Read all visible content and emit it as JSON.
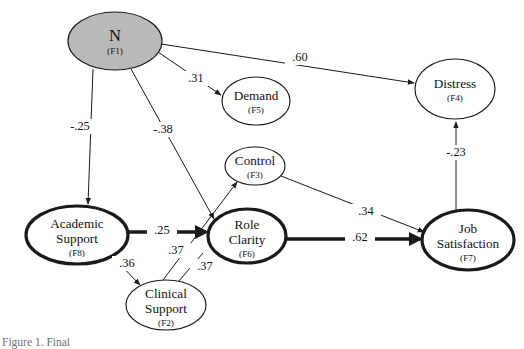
{
  "figure": {
    "type": "structural-equation-model-path-diagram",
    "background_color": "#ffffff",
    "stroke_color": "#1a1a1a",
    "shaded_fill": "#b9b9b9",
    "caption": "Figure 1. Final"
  },
  "nodes": [
    {
      "id": "F1",
      "name": "N",
      "code": "(F1)",
      "cx": 115,
      "cy": 41,
      "rx": 47,
      "ry": 29,
      "style": "shaded",
      "emphasis": "shaded",
      "label_size": "big"
    },
    {
      "id": "F5",
      "name": "Demand",
      "code": "(F5)",
      "cx": 256,
      "cy": 101,
      "rx": 34,
      "ry": 24,
      "style": "thin",
      "emphasis": "normal",
      "label_size": "main"
    },
    {
      "id": "F4",
      "name": "Distress",
      "code": "(F4)",
      "cx": 455,
      "cy": 89,
      "rx": 40,
      "ry": 30,
      "style": "thin",
      "emphasis": "normal",
      "label_size": "main"
    },
    {
      "id": "F3",
      "name": "Control",
      "code": "(F3)",
      "cx": 255,
      "cy": 166,
      "rx": 30,
      "ry": 19,
      "style": "thin",
      "emphasis": "normal",
      "label_size": "main"
    },
    {
      "id": "F8",
      "name": "Academic Support",
      "code": "(F8)",
      "cx": 77,
      "cy": 235,
      "rx": 51,
      "ry": 29,
      "style": "thick",
      "emphasis": "bold",
      "label_size": "main"
    },
    {
      "id": "F6",
      "name": "Role Clarity",
      "code": "(F6)",
      "cx": 247,
      "cy": 236,
      "rx": 39,
      "ry": 27,
      "style": "thick",
      "emphasis": "bold",
      "label_size": "main"
    },
    {
      "id": "F2",
      "name": "Clinical Support",
      "code": "(F2)",
      "cx": 166,
      "cy": 305,
      "rx": 40,
      "ry": 25,
      "style": "thin",
      "emphasis": "normal",
      "label_size": "main"
    },
    {
      "id": "F7",
      "name": "Job Satisfaction",
      "code": "(F7)",
      "cx": 468,
      "cy": 240,
      "rx": 46,
      "ry": 30,
      "style": "thick",
      "emphasis": "bold",
      "label_size": "main"
    }
  ],
  "paths": [
    {
      "id": "p-n-distress",
      "from": "F1",
      "to": "F4",
      "coefficient": ".60",
      "weight": "thin",
      "arrow": true,
      "x1": 161,
      "y1": 44,
      "x2": 414,
      "y2": 83,
      "label_x": 300,
      "label_y": 58
    },
    {
      "id": "p-n-demand",
      "from": "F1",
      "to": "F5",
      "coefficient": ".31",
      "weight": "thin",
      "arrow": true,
      "x1": 158,
      "y1": 52,
      "x2": 221,
      "y2": 95,
      "label_x": 196,
      "label_y": 79
    },
    {
      "id": "p-n-academic",
      "from": "F1",
      "to": "F8",
      "coefficient": "-.25",
      "weight": "thin",
      "arrow": true,
      "x1": 93,
      "y1": 69,
      "x2": 88,
      "y2": 204,
      "label_x": 80,
      "label_y": 127
    },
    {
      "id": "p-n-roleclarity",
      "from": "F1",
      "to": "F6",
      "coefficient": "-.38",
      "weight": "thin",
      "arrow": true,
      "x1": 131,
      "y1": 69,
      "x2": 214,
      "y2": 219,
      "label_x": 163,
      "label_y": 130
    },
    {
      "id": "p-academic-roleclarity",
      "from": "F8",
      "to": "F6",
      "coefficient": ".25",
      "weight": "heavy",
      "arrow": true,
      "x1": 128,
      "y1": 232,
      "x2": 206,
      "y2": 232,
      "label_x": 162,
      "label_y": 231
    },
    {
      "id": "p-academic-clinical",
      "from": "F8",
      "to": "F2",
      "coefficient": ".36",
      "weight": "thin",
      "arrow": true,
      "x1": 113,
      "y1": 257,
      "x2": 140,
      "y2": 285,
      "label_x": 127,
      "label_y": 264
    },
    {
      "id": "p-clinical-roleclarity",
      "from": "F2",
      "to": "F6",
      "coefficient": ".37",
      "weight": "thin",
      "arrow": false,
      "x1": 178,
      "y1": 282,
      "x2": 203,
      "y2": 253,
      "label_x": 205,
      "label_y": 267
    },
    {
      "id": "p-clinical-control",
      "from": "F2",
      "to": "F3",
      "coefficient": ".37",
      "weight": "thin",
      "arrow": true,
      "x1": 163,
      "y1": 280,
      "x2": 237,
      "y2": 182,
      "label_x": 176,
      "label_y": 251
    },
    {
      "id": "p-control-jobsat",
      "from": "F3",
      "to": "F7",
      "coefficient": ".34",
      "weight": "thin",
      "arrow": true,
      "x1": 281,
      "y1": 176,
      "x2": 424,
      "y2": 232,
      "label_x": 366,
      "label_y": 212
    },
    {
      "id": "p-roleclarity-jobsat",
      "from": "F6",
      "to": "F7",
      "coefficient": ".62",
      "weight": "heavy",
      "arrow": true,
      "x1": 286,
      "y1": 239,
      "x2": 420,
      "y2": 239,
      "label_x": 360,
      "label_y": 238
    },
    {
      "id": "p-jobsat-distress",
      "from": "F7",
      "to": "F4",
      "coefficient": "-.23",
      "weight": "thin",
      "arrow": true,
      "x1": 456,
      "y1": 210,
      "x2": 456,
      "y2": 122,
      "label_x": 456,
      "label_y": 153
    }
  ]
}
